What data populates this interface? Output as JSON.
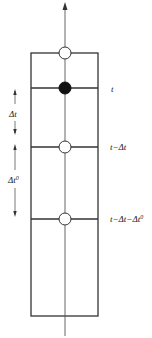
{
  "diagram": {
    "type": "time-stack",
    "axis": {
      "direction": "up",
      "x": 65,
      "y_top": 3,
      "y_bottom": 336
    },
    "box": {
      "left": 31,
      "right": 98,
      "top": 53,
      "bottom": 316
    },
    "levels": [
      {
        "id": "top",
        "y": 53,
        "node": "open",
        "label": ""
      },
      {
        "id": "t",
        "y": 88,
        "node": "filled",
        "label": "t"
      },
      {
        "id": "t-dt",
        "y": 147,
        "node": "open",
        "label": "t−Δt"
      },
      {
        "id": "t-dt-dt0",
        "y": 219,
        "node": "open",
        "label": "t−Δt−Δt",
        "label_sup": "0"
      }
    ],
    "intervals": [
      {
        "id": "dt",
        "label": "Δt",
        "sup": "",
        "y_from": 88,
        "y_to": 147
      },
      {
        "id": "dt0",
        "label": "Δt",
        "sup": "0",
        "y_from": 147,
        "y_to": 219
      }
    ],
    "colors": {
      "line": "#333333",
      "node_fill": "#111111",
      "node_open": "#ffffff"
    }
  }
}
